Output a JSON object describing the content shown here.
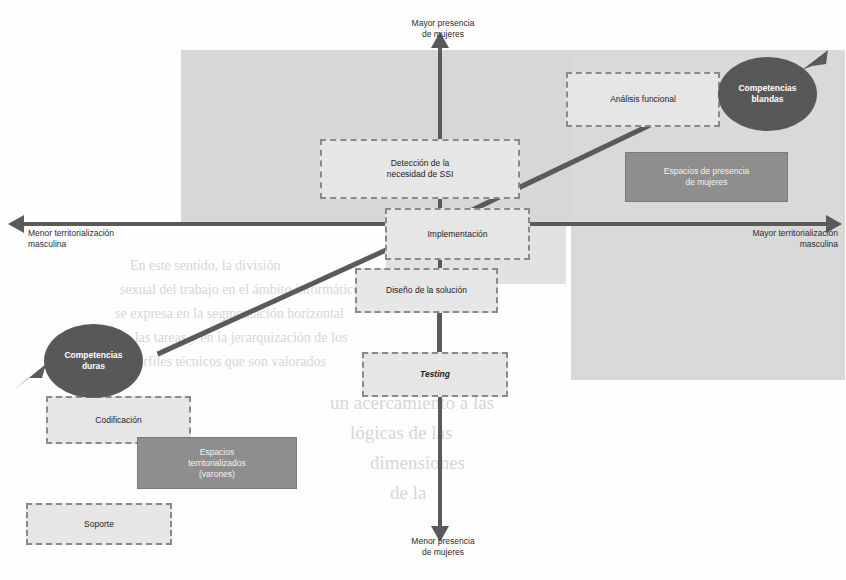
{
  "diagram": {
    "colors": {
      "axis": "#5a5a5a",
      "dashed_box_fill": "#e6e6e6",
      "dashed_box_border": "#8a8a8a",
      "solid_box_fill": "#8e8e8e",
      "ellipse_fill": "#585858",
      "shade_top": "#d7d7d7",
      "shade_right": "#d9d9d9",
      "page_background": "#fefefe"
    },
    "axes": {
      "vertical": {
        "top_label": "Mayor presencia\nde mujeres",
        "bottom_label": "Menor presencia\nde mujeres"
      },
      "horizontal": {
        "left_label": "Menor territorialización\nmasculina",
        "right_label": "Mayor territorialización\nmasculina"
      }
    },
    "process_boxes": [
      {
        "id": "deteccion",
        "label": "Detección de la\nnecesidad de SSI"
      },
      {
        "id": "analisis",
        "label": "Análisis funcional"
      },
      {
        "id": "implementacion",
        "label": "Implementación"
      },
      {
        "id": "diseno",
        "label": "Diseño de la solución"
      },
      {
        "id": "testing",
        "label": "Testing"
      },
      {
        "id": "codificacion",
        "label": "Codificación"
      },
      {
        "id": "soporte",
        "label": "Soporte"
      }
    ],
    "space_boxes": [
      {
        "id": "espacios-mujeres",
        "label": "Espacios de presencia\nde mujeres"
      },
      {
        "id": "espacios-varones",
        "label": "Espacios\nterritorializados\n(varones)"
      }
    ],
    "competency_nodes": [
      {
        "id": "blandas",
        "label": "Competencias\nblandas"
      },
      {
        "id": "duras",
        "label": "Competencias\nduras"
      }
    ]
  },
  "background_bleed": [
    {
      "text": "la dimensión social y organizacional",
      "x": 195,
      "y": 62,
      "size": 15
    },
    {
      "text": "de la tecnología informática, lo que",
      "x": 200,
      "y": 86,
      "size": 15
    },
    {
      "text": "permite comprender mejor cómo",
      "x": 205,
      "y": 110,
      "size": 15
    },
    {
      "text": "se construyen las identidades",
      "x": 200,
      "y": 134,
      "size": 15
    },
    {
      "text": "profesionales en el sector",
      "x": 205,
      "y": 158,
      "size": 15
    },
    {
      "text": "de software y servicios",
      "x": 190,
      "y": 182,
      "size": 15
    },
    {
      "text": "En este sentido, la división",
      "x": 130,
      "y": 258,
      "size": 14
    },
    {
      "text": "sexual del trabajo en el ámbito informático",
      "x": 120,
      "y": 282,
      "size": 14
    },
    {
      "text": "se expresa en la segmentación horizontal",
      "x": 115,
      "y": 306,
      "size": 14
    },
    {
      "text": "de las tareas y en la jerarquización de los",
      "x": 118,
      "y": 330,
      "size": 14
    },
    {
      "text": "perfiles técnicos que son valorados",
      "x": 130,
      "y": 354,
      "size": 14
    },
    {
      "text": "un acercamiento a las",
      "x": 330,
      "y": 392,
      "size": 19
    },
    {
      "text": "lógicas de las",
      "x": 350,
      "y": 422,
      "size": 19
    },
    {
      "text": "dimensiones",
      "x": 370,
      "y": 452,
      "size": 19
    },
    {
      "text": "de la",
      "x": 390,
      "y": 482,
      "size": 19
    }
  ]
}
